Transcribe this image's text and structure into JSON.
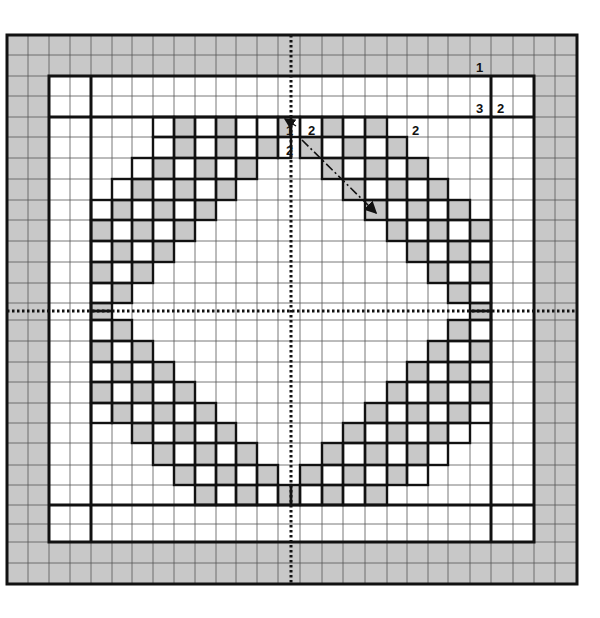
{
  "diagram": {
    "type": "quilt-block-grid",
    "colors": {
      "shade": "#c8c8c8",
      "line": "#555555",
      "thick": "#111111",
      "bg": "#ffffff"
    },
    "xlines": [
      7,
      28,
      49,
      70,
      91,
      112,
      132,
      153,
      174,
      195,
      216,
      236,
      257,
      278,
      291,
      300,
      322,
      343,
      365,
      387,
      407,
      428,
      448,
      470,
      491,
      513,
      534,
      555,
      577
    ],
    "ylines": [
      35,
      55,
      76,
      96,
      117,
      137,
      158,
      179,
      200,
      220,
      241,
      262,
      283,
      303,
      311,
      320,
      341,
      362,
      382,
      403,
      423,
      443,
      465,
      485,
      505,
      524,
      542,
      563,
      584
    ],
    "center": {
      "x": 291,
      "y": 311
    },
    "frame": {
      "outer": [
        7,
        35,
        577,
        584
      ],
      "inner_band": [
        49,
        76,
        534,
        542
      ],
      "center_field": [
        91,
        117,
        491,
        505
      ]
    },
    "diamond_cells": {
      "note": "cell column index i refers to xlines[i]..xlines[i+1]; row index j refers to ylines[j]..ylines[j+1]",
      "shaded": [
        [
          8,
          4
        ],
        [
          10,
          4
        ],
        [
          13,
          4
        ],
        [
          8,
          5
        ],
        [
          10,
          5
        ],
        [
          12,
          5
        ],
        [
          7,
          6
        ],
        [
          9,
          6
        ],
        [
          11,
          6
        ],
        [
          6,
          7
        ],
        [
          8,
          7
        ],
        [
          10,
          7
        ],
        [
          5,
          8
        ],
        [
          7,
          8
        ],
        [
          9,
          8
        ],
        [
          4,
          9
        ],
        [
          6,
          9
        ],
        [
          8,
          9
        ],
        [
          5,
          10
        ],
        [
          7,
          10
        ],
        [
          4,
          11
        ],
        [
          6,
          11
        ],
        [
          5,
          12
        ],
        [
          4,
          13
        ],
        [
          16,
          4
        ],
        [
          18,
          4
        ],
        [
          15,
          5
        ],
        [
          17,
          5
        ],
        [
          19,
          5
        ],
        [
          16,
          6
        ],
        [
          18,
          6
        ],
        [
          20,
          6
        ],
        [
          17,
          7
        ],
        [
          19,
          7
        ],
        [
          21,
          7
        ],
        [
          18,
          8
        ],
        [
          20,
          8
        ],
        [
          22,
          8
        ],
        [
          19,
          9
        ],
        [
          21,
          9
        ],
        [
          23,
          9
        ],
        [
          20,
          10
        ],
        [
          22,
          10
        ],
        [
          21,
          11
        ],
        [
          23,
          11
        ],
        [
          22,
          12
        ],
        [
          23,
          13
        ],
        [
          4,
          14
        ],
        [
          5,
          15
        ],
        [
          4,
          16
        ],
        [
          6,
          16
        ],
        [
          5,
          17
        ],
        [
          7,
          17
        ],
        [
          4,
          18
        ],
        [
          6,
          18
        ],
        [
          8,
          18
        ],
        [
          5,
          19
        ],
        [
          7,
          19
        ],
        [
          9,
          19
        ],
        [
          6,
          20
        ],
        [
          8,
          20
        ],
        [
          10,
          20
        ],
        [
          7,
          21
        ],
        [
          9,
          21
        ],
        [
          11,
          21
        ],
        [
          8,
          22
        ],
        [
          10,
          22
        ],
        [
          12,
          22
        ],
        [
          9,
          23
        ],
        [
          11,
          23
        ],
        [
          13,
          23
        ],
        [
          23,
          14
        ],
        [
          22,
          15
        ],
        [
          21,
          16
        ],
        [
          23,
          16
        ],
        [
          20,
          17
        ],
        [
          22,
          17
        ],
        [
          19,
          18
        ],
        [
          21,
          18
        ],
        [
          23,
          18
        ],
        [
          18,
          19
        ],
        [
          20,
          19
        ],
        [
          22,
          19
        ],
        [
          17,
          20
        ],
        [
          19,
          20
        ],
        [
          21,
          20
        ],
        [
          16,
          21
        ],
        [
          18,
          21
        ],
        [
          20,
          21
        ],
        [
          15,
          22
        ],
        [
          17,
          22
        ],
        [
          19,
          22
        ],
        [
          14,
          23
        ],
        [
          16,
          23
        ],
        [
          18,
          23
        ]
      ],
      "outlined": [
        [
          7,
          4
        ],
        [
          9,
          4
        ],
        [
          11,
          4
        ],
        [
          12,
          4
        ],
        [
          14,
          4
        ],
        [
          15,
          4
        ],
        [
          17,
          4
        ],
        [
          7,
          5
        ],
        [
          9,
          5
        ],
        [
          11,
          5
        ],
        [
          13,
          5
        ],
        [
          16,
          5
        ],
        [
          18,
          5
        ],
        [
          6,
          6
        ],
        [
          8,
          6
        ],
        [
          10,
          6
        ],
        [
          17,
          6
        ],
        [
          19,
          6
        ],
        [
          5,
          7
        ],
        [
          7,
          7
        ],
        [
          9,
          7
        ],
        [
          18,
          7
        ],
        [
          20,
          7
        ],
        [
          4,
          8
        ],
        [
          6,
          8
        ],
        [
          8,
          8
        ],
        [
          19,
          8
        ],
        [
          21,
          8
        ],
        [
          5,
          9
        ],
        [
          7,
          9
        ],
        [
          20,
          9
        ],
        [
          22,
          9
        ],
        [
          4,
          10
        ],
        [
          6,
          10
        ],
        [
          21,
          10
        ],
        [
          23,
          10
        ],
        [
          5,
          11
        ],
        [
          22,
          11
        ],
        [
          4,
          12
        ],
        [
          23,
          12
        ],
        [
          4,
          15
        ],
        [
          23,
          15
        ],
        [
          5,
          16
        ],
        [
          22,
          16
        ],
        [
          4,
          17
        ],
        [
          6,
          17
        ],
        [
          21,
          17
        ],
        [
          23,
          17
        ],
        [
          5,
          18
        ],
        [
          7,
          18
        ],
        [
          20,
          18
        ],
        [
          22,
          18
        ],
        [
          4,
          19
        ],
        [
          6,
          19
        ],
        [
          8,
          19
        ],
        [
          19,
          19
        ],
        [
          21,
          19
        ],
        [
          23,
          19
        ],
        [
          7,
          20
        ],
        [
          9,
          20
        ],
        [
          18,
          20
        ],
        [
          20,
          20
        ],
        [
          22,
          20
        ],
        [
          8,
          21
        ],
        [
          10,
          21
        ],
        [
          17,
          21
        ],
        [
          19,
          21
        ],
        [
          21,
          21
        ],
        [
          9,
          22
        ],
        [
          11,
          22
        ],
        [
          16,
          22
        ],
        [
          18,
          22
        ],
        [
          20,
          22
        ],
        [
          10,
          23
        ],
        [
          12,
          23
        ],
        [
          15,
          23
        ],
        [
          17,
          23
        ]
      ]
    },
    "labels": [
      {
        "text": "1",
        "x": 476,
        "y": 61
      },
      {
        "text": "3",
        "x": 476,
        "y": 102
      },
      {
        "text": "2",
        "x": 497,
        "y": 102
      },
      {
        "text": "1",
        "x": 286,
        "y": 124
      },
      {
        "text": "2",
        "x": 308,
        "y": 124
      },
      {
        "text": "2",
        "x": 412,
        "y": 124
      },
      {
        "text": "2",
        "x": 286,
        "y": 144
      }
    ],
    "arrow": {
      "from": [
        302,
        140
      ],
      "to": [
        376,
        213
      ]
    },
    "small_arrow": {
      "from": [
        296,
        126
      ],
      "to": [
        285,
        119
      ]
    }
  }
}
